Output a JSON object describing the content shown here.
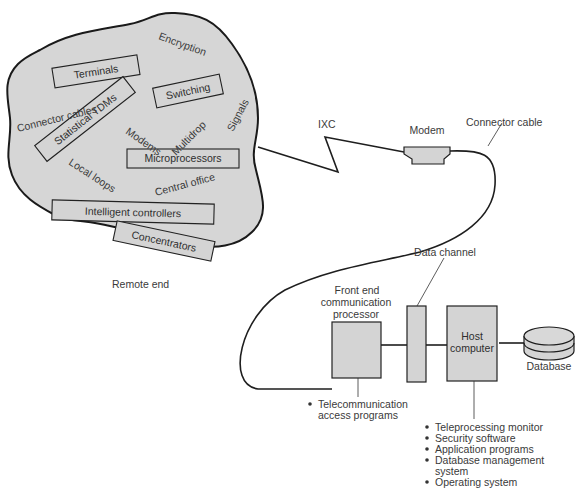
{
  "diagram": {
    "type": "telecommunications network overview",
    "remote_end": {
      "caption": "Remote end",
      "boxed_items": {
        "terminals": "Terminals",
        "statistical_tdms": "Statistical TDMs",
        "switching": "Switching",
        "microprocessors": "Microprocessors",
        "intelligent_controllers": "Intelligent controllers",
        "concentrators": "Concentrators"
      },
      "floating_labels": {
        "encryption": "Encryption",
        "connector_cables": "Connector cables",
        "modems": "Modems",
        "multidrop": "Multidrop",
        "signals": "Signals",
        "local_loops": "Local loops",
        "central_office": "Central office"
      }
    },
    "link": {
      "ixc": "IXC",
      "modem": "Modem",
      "connector_cable": "Connector cable"
    },
    "host_end": {
      "data_channel": "Data channel",
      "front_end": {
        "line1": "Front end",
        "line2": "communication",
        "line3": "processor"
      },
      "front_end_programs": {
        "line1": "Telecommunication",
        "line2": "access programs"
      },
      "host_computer": {
        "line1": "Host",
        "line2": "computer"
      },
      "database": "Database",
      "host_software": {
        "item1": "Teleprocessing monitor",
        "item2": "Security software",
        "item3": "Application programs",
        "item4a": "Database management",
        "item4b": "system",
        "item5": "Operating system"
      }
    },
    "colors": {
      "fill_gray": "#d4d4d4",
      "stroke": "#1e1e1e",
      "text": "#3a3a3a"
    }
  }
}
